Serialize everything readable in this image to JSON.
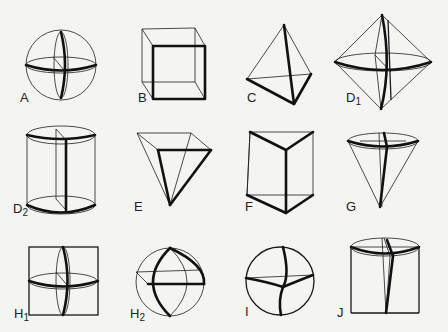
{
  "figure": {
    "title": "",
    "shapes": [
      {
        "id": "A",
        "label": "A",
        "sub": "",
        "shape": "sphere"
      },
      {
        "id": "B",
        "label": "B",
        "sub": "",
        "shape": "cube"
      },
      {
        "id": "C",
        "label": "C",
        "sub": "",
        "shape": "tetrahedron"
      },
      {
        "id": "D1",
        "label": "D",
        "sub": "1",
        "shape": "octahedron"
      },
      {
        "id": "D2",
        "label": "D",
        "sub": "2",
        "shape": "cylinder"
      },
      {
        "id": "E",
        "label": "E",
        "sub": "",
        "shape": "inverted square pyramid"
      },
      {
        "id": "F",
        "label": "F",
        "sub": "",
        "shape": "triangular prism"
      },
      {
        "id": "G",
        "label": "G",
        "sub": "",
        "shape": "inverted cone"
      },
      {
        "id": "H1",
        "label": "H",
        "sub": "1",
        "shape": "square with inscribed ellipses"
      },
      {
        "id": "H2",
        "label": "H",
        "sub": "2",
        "shape": "sphere with lens section"
      },
      {
        "id": "I",
        "label": "I",
        "sub": "",
        "shape": "sphere with curved triangle"
      },
      {
        "id": "J",
        "label": "J",
        "sub": "",
        "shape": "cylinder with cone"
      }
    ]
  }
}
